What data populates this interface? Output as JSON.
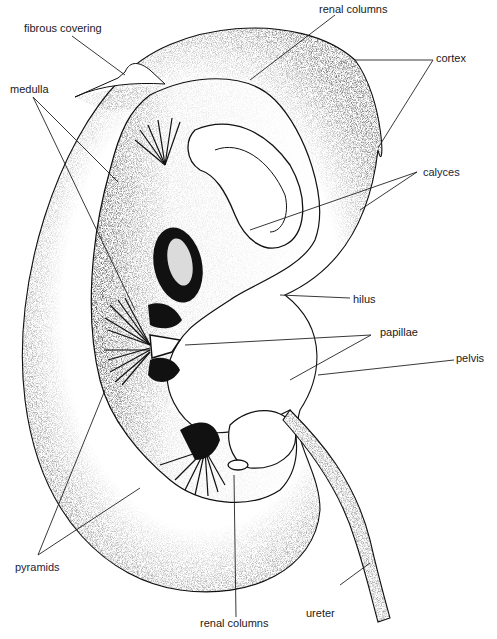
{
  "figure": {
    "colors": {
      "ink": "#111111",
      "background": "#ffffff",
      "label_text": "#1a1a1a"
    }
  },
  "labels": {
    "fibrous_covering": "fibrous covering",
    "renal_columns_top": "renal columns",
    "cortex": "cortex",
    "medulla": "medulla",
    "calyces": "calyces",
    "hilus": "hilus",
    "papillae": "papillae",
    "pelvis": "pelvis",
    "pyramids": "pyramids",
    "ureter": "ureter",
    "renal_columns_bottom": "renal columns"
  }
}
